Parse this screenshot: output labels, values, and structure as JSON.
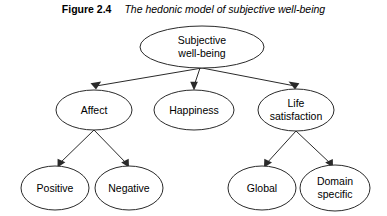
{
  "figure": {
    "label": "Figure 2.4",
    "title": "The hedonic model of subjective well-being"
  },
  "diagram": {
    "type": "tree",
    "orientation": "top-down",
    "node_shape": "ellipse",
    "colors": {
      "background": "#ffffff",
      "stroke": "#2a2a2a",
      "text": "#000000",
      "fill": "#ffffff"
    },
    "nodes": {
      "root": {
        "id": "subjective-well-being",
        "line1": "Subjective",
        "line2": "well-being",
        "cx": 202,
        "cy": 47,
        "rx": 62,
        "ry": 21
      },
      "affect": {
        "id": "affect",
        "line1": "Affect",
        "line2": "",
        "cx": 94,
        "cy": 110,
        "rx": 38,
        "ry": 20
      },
      "happiness": {
        "id": "happiness",
        "line1": "Happiness",
        "line2": "",
        "cx": 194,
        "cy": 110,
        "rx": 40,
        "ry": 20
      },
      "life_satisfaction": {
        "id": "life-satisfaction",
        "line1": "Life",
        "line2": "satisfaction",
        "cx": 296,
        "cy": 110,
        "rx": 38,
        "ry": 21
      },
      "positive": {
        "id": "positive",
        "line1": "Positive",
        "line2": "",
        "cx": 55,
        "cy": 188,
        "rx": 34,
        "ry": 22
      },
      "negative": {
        "id": "negative",
        "line1": "Negative",
        "line2": "",
        "cx": 129,
        "cy": 188,
        "rx": 34,
        "ry": 22
      },
      "global": {
        "id": "global",
        "line1": "Global",
        "line2": "",
        "cx": 262,
        "cy": 188,
        "rx": 34,
        "ry": 22
      },
      "domain_specific": {
        "id": "domain-specific",
        "line1": "Domain",
        "line2": "specific",
        "cx": 335,
        "cy": 188,
        "rx": 35,
        "ry": 23
      }
    },
    "edges": [
      {
        "from": "subjective-well-being",
        "to": "affect",
        "arrow": true
      },
      {
        "from": "subjective-well-being",
        "to": "happiness",
        "arrow": true
      },
      {
        "from": "subjective-well-being",
        "to": "life-satisfaction",
        "arrow": true
      },
      {
        "from": "affect",
        "to": "positive",
        "arrow": true
      },
      {
        "from": "affect",
        "to": "negative",
        "arrow": true
      },
      {
        "from": "life-satisfaction",
        "to": "global",
        "arrow": true
      },
      {
        "from": "life-satisfaction",
        "to": "domain-specific",
        "arrow": true
      }
    ]
  }
}
